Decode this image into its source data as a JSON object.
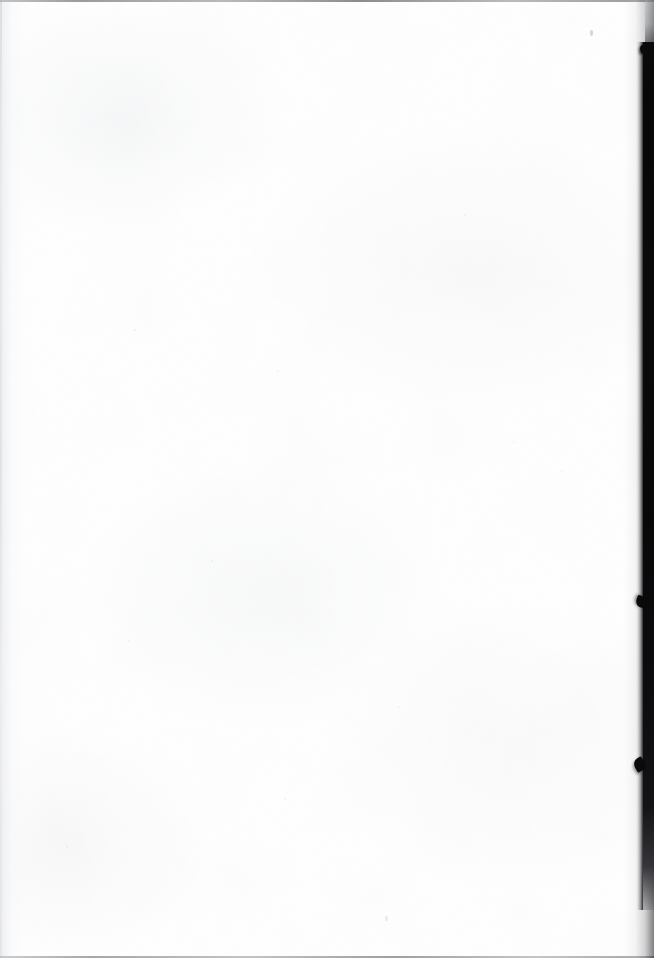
{
  "document": {
    "kind": "scanned-page",
    "page_content_text": "",
    "page_state_label": "Blank page",
    "orientation": "portrait"
  },
  "canvas": {
    "width": 654,
    "height": 958
  },
  "paper": {
    "label": "Scanned paper sheet",
    "background_color": "#ffffff",
    "texture_tint_color": "#f7f8f8"
  },
  "edges": {
    "top_line": {
      "label": "Top scan edge line",
      "color": "#78797e"
    },
    "bottom_line": {
      "label": "Bottom scan edge line",
      "color": "#7e8084"
    },
    "left_line": {
      "label": "Left page edge",
      "color": "#d8dadc"
    }
  },
  "gutter": {
    "label": "Right gutter scanner shadow",
    "band_color": "#0a0a0b",
    "shadow_color": "#161618",
    "starts_at_y": 42,
    "width_px": 11
  },
  "edge_notches": [
    {
      "label": "Upper edge notch",
      "y": 44
    },
    {
      "label": "Middle edge notch",
      "y": 596
    },
    {
      "label": "Lower edge notch",
      "y": 758
    }
  ],
  "specks": [
    {
      "label": "Ink speck near top right",
      "x": 590,
      "y": 30
    },
    {
      "label": "Ink speck near bottom center",
      "x": 385,
      "y": 916
    }
  ]
}
